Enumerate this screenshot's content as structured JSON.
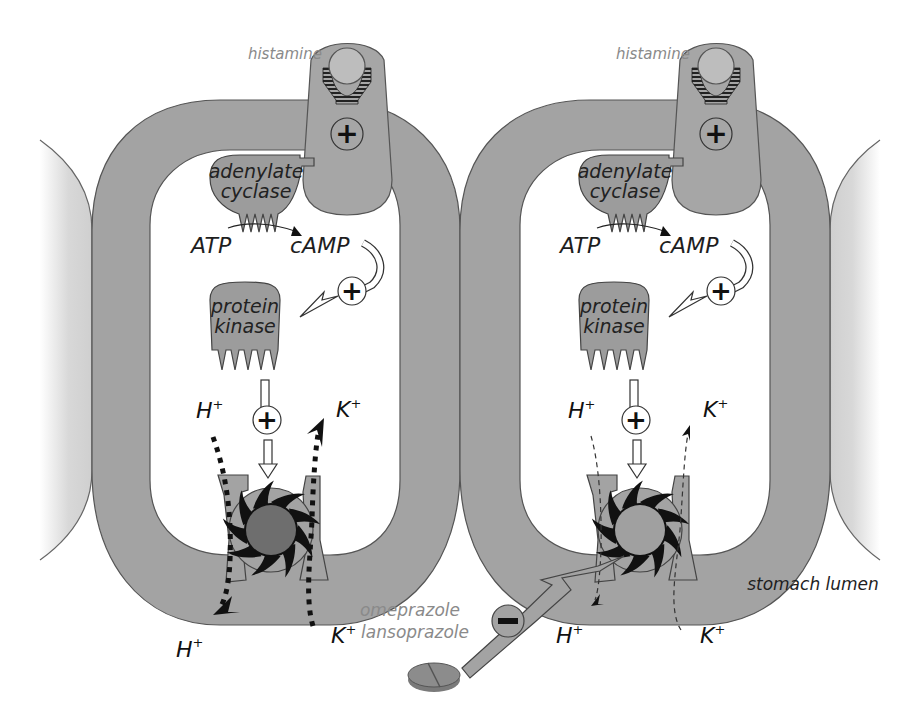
{
  "diagram": {
    "colors": {
      "membrane": "#a3a3a3",
      "membrane_stroke": "#555555",
      "protein": "#9c9c9c",
      "neighbor_cell": "#d9d9d9",
      "pump_core": "#6e6e6e",
      "pump_core_inhibited": "#a0a0a0",
      "arrow_fill": "#ffffff",
      "label_grey": "#8a8a8a",
      "label_dark": "#1e1e1e"
    },
    "panels": [
      {
        "state": "active",
        "ligand_label": "histamine",
        "receptor_sign": "+",
        "enzyme_label_line1": "adenylate",
        "enzyme_label_line2": "cyclase",
        "substrate_label": "ATP",
        "product_label": "cAMP",
        "camp_sign": "+",
        "kinase_label_line1": "protein",
        "kinase_label_line2": "kinase",
        "kinase_sign": "+",
        "h_in": {
          "ion": "H",
          "charge": "+"
        },
        "k_in": {
          "ion": "K",
          "charge": "+"
        },
        "h_out": {
          "ion": "H",
          "charge": "+"
        },
        "k_out": {
          "ion": "K",
          "charge": "+"
        },
        "ion_flow": "strong"
      },
      {
        "state": "inhibited",
        "ligand_label": "histamine",
        "receptor_sign": "+",
        "enzyme_label_line1": "adenylate",
        "enzyme_label_line2": "cyclase",
        "substrate_label": "ATP",
        "product_label": "cAMP",
        "camp_sign": "+",
        "kinase_label_line1": "protein",
        "kinase_label_line2": "kinase",
        "kinase_sign": "+",
        "h_in": {
          "ion": "H",
          "charge": "+"
        },
        "k_in": {
          "ion": "K",
          "charge": "+"
        },
        "h_out": {
          "ion": "H",
          "charge": "+"
        },
        "k_out": {
          "ion": "K",
          "charge": "+"
        },
        "ion_flow": "weak"
      }
    ],
    "inhibitor": {
      "drug_line1": "omeprazole",
      "drug_line2": "lansoprazole",
      "sign": "−",
      "icon": "pill-icon"
    },
    "region_label": "stomach lumen"
  }
}
